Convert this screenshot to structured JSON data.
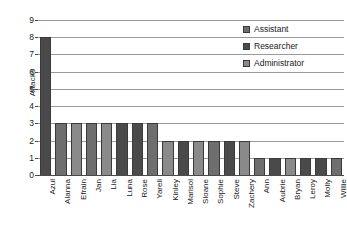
{
  "chart_data": {
    "type": "bar",
    "title": "",
    "xlabel": "",
    "ylabel": "Attacks",
    "ylim": [
      0,
      9
    ],
    "yticks": [
      0,
      1,
      2,
      3,
      4,
      5,
      6,
      7,
      8,
      9
    ],
    "grid": true,
    "legend_position": "top-right",
    "categories": [
      "Azul",
      "Alanna",
      "Efrain",
      "Jan",
      "Lia",
      "Luna",
      "Rose",
      "Yareli",
      "Kinley",
      "Marisol",
      "Sloane",
      "Sophie",
      "Steve",
      "Zachery",
      "Ann",
      "Aubrie",
      "Bryan",
      "Leroy",
      "Molly",
      "Willie"
    ],
    "values": [
      8,
      3,
      3,
      3,
      3,
      3,
      3,
      3,
      2,
      2,
      2,
      2,
      2,
      2,
      1,
      1,
      1,
      1,
      1,
      1
    ],
    "bar_roles": [
      "Researcher",
      "Assistant",
      "Administrator",
      "Assistant",
      "Administrator",
      "Researcher",
      "Researcher",
      "Assistant",
      "Administrator",
      "Researcher",
      "Administrator",
      "Assistant",
      "Researcher",
      "Administrator",
      "Assistant",
      "Researcher",
      "Administrator",
      "Researcher",
      "Researcher",
      "Assistant"
    ],
    "legend": [
      {
        "label": "Assistant",
        "color": "#6e6e6e"
      },
      {
        "label": "Researcher",
        "color": "#4a4a4a"
      },
      {
        "label": "Administrator",
        "color": "#8a8a8a"
      }
    ],
    "colors": {
      "Assistant": "#6e6e6e",
      "Researcher": "#4a4a4a",
      "Administrator": "#8a8a8a",
      "gridline": "#9a9a9a",
      "axis": "#4a4a4a",
      "background": "#ffffff",
      "text": "#1a1a1a"
    }
  }
}
